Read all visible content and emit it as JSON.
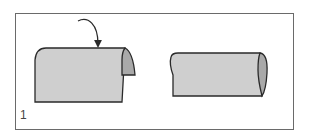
{
  "diagram": {
    "step_number": "1",
    "colors": {
      "paper_fill": "#cfcfcf",
      "paper_inner_fill": "#a9a9a9",
      "outline": "#2a2a2a",
      "frame": "#6a6a6a"
    },
    "panels": [
      {
        "name": "before-fold",
        "description": "Sheet with right edge curling over, arrow indicating fold direction"
      },
      {
        "name": "after-fold",
        "description": "Sheet rolled into a tube shape"
      }
    ]
  }
}
